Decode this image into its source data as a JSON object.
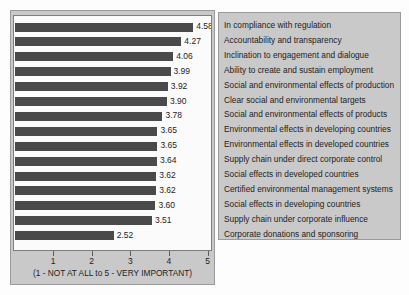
{
  "chart_data": {
    "type": "bar",
    "orientation": "horizontal",
    "title": "",
    "xlabel": "(1 - NOT AT ALL to 5 - VERY IMPORTANT)",
    "ylabel": "",
    "xlim": [
      0,
      5
    ],
    "xticks": [
      "1",
      "2",
      "3",
      "4",
      "5"
    ],
    "grid": false,
    "legend_position": "right",
    "bar_color": "#4a4a4a",
    "categories": [
      "In compliance with regulation",
      "Accountability and transparency",
      "Inclination to engagement and dialogue",
      "Ability to create and sustain employment",
      "Social and environmental effects of production",
      "Clear social and environmental targets",
      "Social and environmental effects of products",
      "Environmental effects in developing countries",
      "Environmental effects in developed countries",
      "Supply chain under direct corporate control",
      "Social effects in developed countries",
      "Certified environmental management systems",
      "Social effects in developing countries",
      "Supply chain under corporate influence",
      "Corporate donations and sponsoring"
    ],
    "values": [
      4.58,
      4.27,
      4.06,
      3.99,
      3.92,
      3.9,
      3.78,
      3.65,
      3.65,
      3.64,
      3.62,
      3.62,
      3.6,
      3.51,
      2.52
    ],
    "value_labels": [
      "4.58",
      "4.27",
      "4.06",
      "3.99",
      "3.92",
      "3.90",
      "3.78",
      "3.65",
      "3.65",
      "3.64",
      "3.62",
      "3.62",
      "3.60",
      "3.51",
      "2.52"
    ]
  }
}
